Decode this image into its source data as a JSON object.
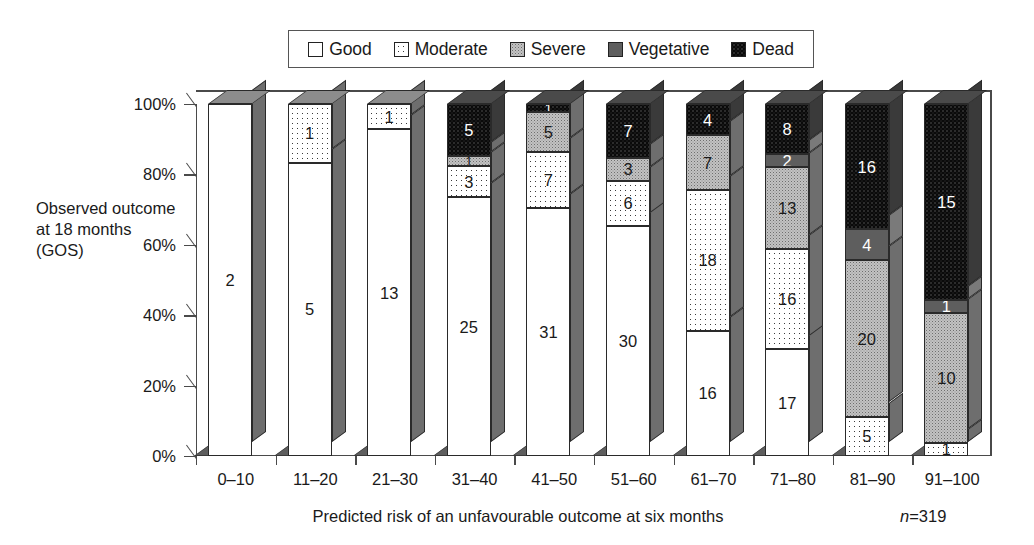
{
  "chart_data": {
    "type": "bar",
    "subtype": "stacked-percentage-3d",
    "title": "",
    "xlabel": "Predicted risk of an unfavourable outcome at six months",
    "ylabel": "Observed outcome at 18 months (GOS)",
    "note": "n=319",
    "note_italic_prefix": "n",
    "note_rest": "=319",
    "total_n": 319,
    "ylim": [
      0,
      100
    ],
    "yticks": [
      "0%",
      "20%",
      "40%",
      "60%",
      "80%",
      "100%"
    ],
    "ytick_values": [
      0,
      20,
      40,
      60,
      80,
      100
    ],
    "grid": false,
    "legend_position": "top",
    "categories": [
      "0–10",
      "11–20",
      "21–30",
      "31–40",
      "41–50",
      "51–60",
      "61–70",
      "71–80",
      "81–90",
      "91–100"
    ],
    "series": [
      {
        "name": "Good",
        "fill": "good",
        "swatch_color": "#ffffff",
        "values": [
          2,
          5,
          13,
          25,
          31,
          30,
          16,
          17,
          0,
          0
        ]
      },
      {
        "name": "Moderate",
        "fill": "moderate",
        "swatch_color": "#f2f2f2",
        "values": [
          0,
          1,
          1,
          3,
          7,
          6,
          18,
          16,
          5,
          1
        ]
      },
      {
        "name": "Severe",
        "fill": "severe",
        "swatch_color": "#c2c2c2",
        "values": [
          0,
          0,
          0,
          1,
          5,
          3,
          7,
          13,
          20,
          10
        ]
      },
      {
        "name": "Vegetative",
        "fill": "vegetative",
        "swatch_color": "#5e5e5e",
        "values": [
          0,
          0,
          0,
          0,
          0,
          0,
          0,
          2,
          4,
          1
        ]
      },
      {
        "name": "Dead",
        "fill": "dead",
        "swatch_color": "#0a0a0a",
        "values": [
          0,
          0,
          0,
          5,
          1,
          7,
          4,
          8,
          16,
          15
        ]
      }
    ],
    "column_totals": [
      2,
      6,
      14,
      34,
      44,
      46,
      45,
      56,
      45,
      27
    ]
  },
  "legend": {
    "items": [
      {
        "label": "Good",
        "fill": "good"
      },
      {
        "label": "Moderate",
        "fill": "moderate"
      },
      {
        "label": "Severe",
        "fill": "severe"
      },
      {
        "label": "Vegetative",
        "fill": "vegetative"
      },
      {
        "label": "Dead",
        "fill": "dead"
      }
    ]
  },
  "colors": {
    "axis": "#4a4a4a",
    "text": "#1a1a1a",
    "bar_side_face": "#6e6e6e",
    "bar_top_face": "#8c8c8c",
    "dead": "#0a0a0a",
    "vegetative": "#5e5e5e",
    "severe": "#c2c2c2",
    "moderate": "#ffffff",
    "good": "#ffffff"
  }
}
